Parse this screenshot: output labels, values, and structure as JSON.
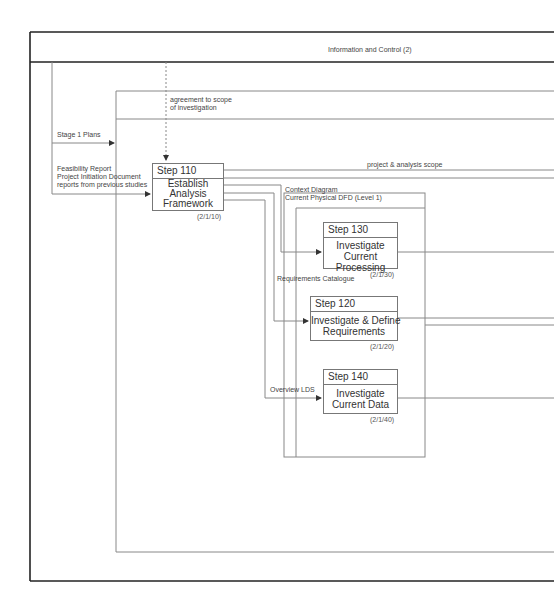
{
  "diagram": {
    "header_title": "Information and Control (2)",
    "flows": {
      "agreement": "agreement to scope\nof investigation",
      "stage1": "Stage 1 Plans",
      "feasibility": "Feasibility Report\nProject Initiation Document\nreports from previous studies",
      "scope": "project & analysis scope",
      "context": "Context Diagram\nCurrent Physical DFD (Level 1)",
      "requirements": "Requirements Catalogue",
      "overview_lds": "Overview LDS"
    },
    "steps": [
      {
        "number": "Step  110",
        "title": "Establish\nAnalysis\nFramework",
        "ref": "(2/1/10)"
      },
      {
        "number": "Step  130",
        "title": "Investigate\nCurrent\nProcessing",
        "ref": "(2/1/30)"
      },
      {
        "number": "Step  120",
        "title": "Investigate & Define\nRequirements",
        "ref": "(2/1/20)"
      },
      {
        "number": "Step  140",
        "title": "Investigate\nCurrent Data",
        "ref": "(2/1/40)"
      }
    ],
    "colors": {
      "frame": "#222222",
      "line": "#888888"
    }
  }
}
